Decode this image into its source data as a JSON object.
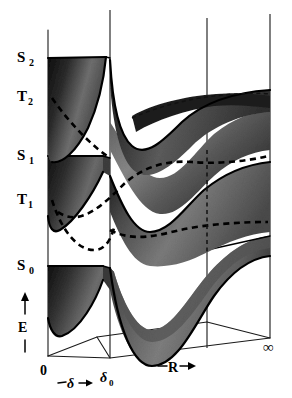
{
  "figure": {
    "type": "potential-energy-surface-diagram",
    "title": "",
    "background_color": "#ffffff",
    "ink_color": "#000000",
    "surface_color_dark": "#1b1b1b",
    "surface_color_mid": "#6a6a6a",
    "surface_color_light": "#b4b4b4"
  },
  "axes": {
    "energy": {
      "label": "E",
      "arrow_glyph": "↑",
      "tick_glyph": "│",
      "direction": "up"
    },
    "delta": {
      "origin_label": "0",
      "label": "−δ→",
      "label_text": "δ",
      "prefix_dash": "−",
      "arrow_glyph": "→",
      "end_label": "δ",
      "end_label_sub": "0"
    },
    "r": {
      "label": "−R→",
      "label_text": "R",
      "prefix_dash": "−",
      "arrow_glyph": "→",
      "end_label": "∞"
    }
  },
  "states": [
    {
      "id": "S2",
      "letter": "S",
      "sub": "2",
      "kind": "singlet",
      "line_style": "solid",
      "y": 57
    },
    {
      "id": "T2",
      "letter": "T",
      "sub": "2",
      "kind": "triplet",
      "line_style": "dashed",
      "y": 96
    },
    {
      "id": "S1",
      "letter": "S",
      "sub": "1",
      "kind": "singlet",
      "line_style": "solid",
      "y": 155
    },
    {
      "id": "T1",
      "letter": "T",
      "sub": "1",
      "kind": "triplet",
      "line_style": "dashed",
      "y": 199
    },
    {
      "id": "S0",
      "letter": "S",
      "sub": "0",
      "kind": "singlet",
      "line_style": "solid",
      "y": 265
    }
  ]
}
